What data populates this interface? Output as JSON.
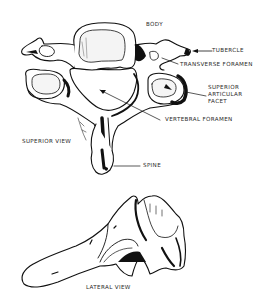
{
  "diagram": {
    "views": [
      {
        "id": "superior",
        "caption": "SUPERIOR VIEW"
      },
      {
        "id": "lateral",
        "caption": "LATERAL VIEW"
      }
    ],
    "labels": {
      "body": "BODY",
      "tubercle": "TUBERCLE",
      "transverse_foramen": "TRANSVERSE FORAMEN",
      "superior_articular_facet": [
        "SUPERIOR",
        "ARTICULAR",
        "FACET"
      ],
      "vertebral_foramen": "VERTEBRAL FORAMEN",
      "spine": "SPINE"
    },
    "colors": {
      "ink": "#111111",
      "background": "#ffffff",
      "label_text": "#2a2a2a"
    }
  }
}
